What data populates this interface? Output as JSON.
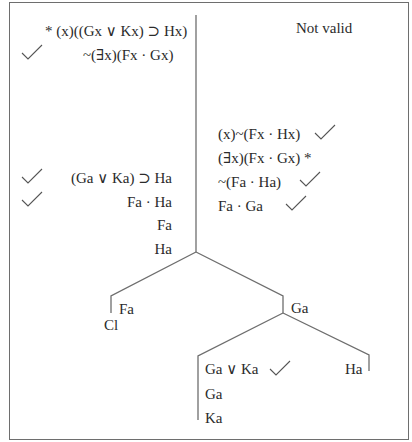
{
  "verdict": "Not valid",
  "left_premises": [
    {
      "text": "* (x)((Gx ∨ Kx) ⊃ Hx)",
      "checked": false
    },
    {
      "text": "~(∃x)(Fx · Gx)",
      "checked": true
    }
  ],
  "right_lines": [
    {
      "text": "(x)~(Fx · Hx)",
      "checked": true
    },
    {
      "text": "(∃x)(Fx · Gx) *",
      "checked": false
    },
    {
      "text": "~(Fa · Ha)",
      "checked": true
    },
    {
      "text": "Fa · Ga",
      "checked": true
    }
  ],
  "left_derived": [
    {
      "text": "(Ga ∨ Ka) ⊃ Ha",
      "checked": true
    },
    {
      "text": "Fa · Ha",
      "checked": true
    },
    {
      "text": "Fa",
      "checked": false
    },
    {
      "text": "Ha",
      "checked": false
    }
  ],
  "tree": {
    "branch_left": {
      "label": "Fa",
      "status": "Cl"
    },
    "branch_right": {
      "label": "Ga"
    },
    "sub_left": [
      {
        "text": "Ga ∨ Ka",
        "checked": true
      },
      {
        "text": "Ga",
        "checked": false
      },
      {
        "text": "Ka",
        "checked": false
      }
    ],
    "sub_right": {
      "label": "Ha"
    }
  },
  "colors": {
    "ink": "#2b2b2b",
    "line": "#6e6e6e",
    "background": "#ffffff"
  }
}
